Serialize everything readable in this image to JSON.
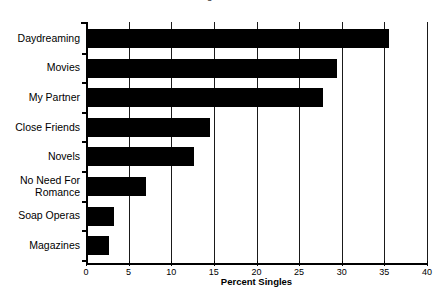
{
  "chart_data": {
    "type": "bar",
    "orientation": "horizontal",
    "title": "Figure 10.1",
    "title_clipped": true,
    "xlabel": "Percent Singles",
    "ylabel": "",
    "xlim": [
      0,
      40
    ],
    "xticks": [
      0,
      5,
      10,
      15,
      20,
      25,
      30,
      35,
      40
    ],
    "grid": "vertical",
    "legend": "none",
    "bar_color": "#000000",
    "categories": [
      "Daydreaming",
      "Movies",
      "My Partner",
      "Close Friends",
      "Novels",
      "No Need For\nRomance",
      "Soap Operas",
      "Magazines"
    ],
    "values": [
      35.5,
      29.5,
      27.8,
      14.5,
      12.7,
      7.0,
      3.3,
      2.7
    ],
    "series": [
      {
        "name": "Percent Singles",
        "values": [
          35.5,
          29.5,
          27.8,
          14.5,
          12.7,
          7.0,
          3.3,
          2.7
        ]
      }
    ]
  },
  "figure": {
    "background": "#ffffff",
    "axis_color": "#000000"
  }
}
